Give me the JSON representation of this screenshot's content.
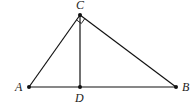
{
  "diagram": {
    "type": "geometry-right-triangle-with-altitude",
    "points": {
      "A": {
        "label": "A",
        "x": 29,
        "y": 87
      },
      "B": {
        "label": "B",
        "x": 176,
        "y": 87
      },
      "C": {
        "label": "C",
        "x": 80,
        "y": 15
      },
      "D": {
        "label": "D",
        "x": 80,
        "y": 87
      }
    },
    "segments": [
      "AC",
      "CB",
      "AB",
      "CD"
    ],
    "right_angle_at": "C",
    "colors": {
      "stroke": "#111111",
      "label": "#222222",
      "background": "#ffffff"
    }
  }
}
